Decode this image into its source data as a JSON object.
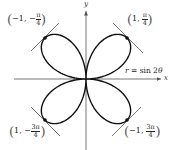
{
  "figure": {
    "curve_label": "r = sin 2θ",
    "curve_label_parts": {
      "lhs": "r",
      "op": " = sin 2",
      "var": "θ"
    },
    "axes": {
      "x_label": "x",
      "y_label": "y"
    },
    "colors": {
      "curve": "#111111",
      "axes": "#555555",
      "tangent": "#333333",
      "text": "#222222",
      "background": "#ffffff"
    },
    "points": [
      {
        "id": "q1",
        "r": "1",
        "theta_num": "π",
        "theta_den": "4",
        "theta_sign": "",
        "label": "(1, π/4)"
      },
      {
        "id": "q2",
        "r": "−1",
        "theta_num": "π",
        "theta_den": "4",
        "theta_sign": "−",
        "label": "(−1, −π/4)"
      },
      {
        "id": "q3",
        "r": "1",
        "theta_num": "3π",
        "theta_den": "4",
        "theta_sign": "−",
        "label": "(1, −3π/4)"
      },
      {
        "id": "q4",
        "r": "−1",
        "theta_num": "3π",
        "theta_den": "4",
        "theta_sign": "",
        "label": "(−1, 3π/4)"
      }
    ]
  },
  "chart_data": {
    "type": "line",
    "title": "",
    "equation": "r = sin 2θ",
    "xlabel": "x",
    "ylabel": "y",
    "grid": false,
    "marked_points": [
      {
        "polar": "(1, π/4)",
        "x": 0.707,
        "y": 0.707
      },
      {
        "polar": "(−1, −π/4)",
        "x": -0.707,
        "y": 0.707
      },
      {
        "polar": "(1, −3π/4)",
        "x": -0.707,
        "y": -0.707
      },
      {
        "polar": "(−1, 3π/4)",
        "x": 0.707,
        "y": -0.707
      }
    ],
    "tangent_lines_at_points": true
  }
}
